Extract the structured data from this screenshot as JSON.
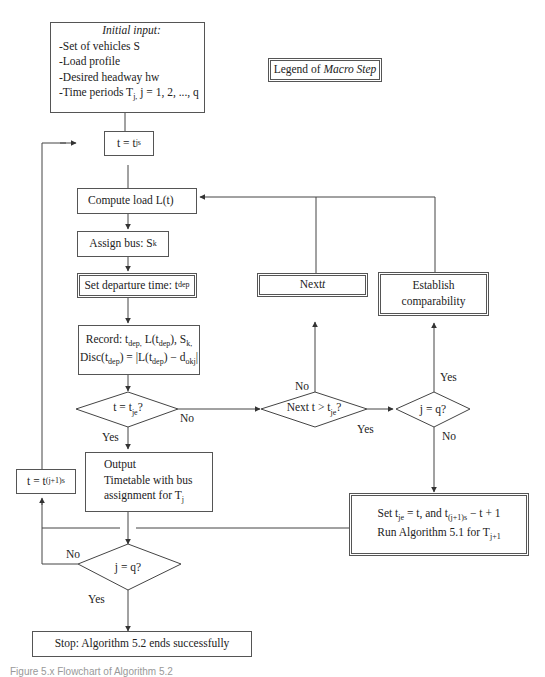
{
  "diagram": {
    "type": "flowchart",
    "initial_input": {
      "title": "Initial input:",
      "items": [
        "-Set of vehicles S",
        "-Load profile",
        "-Desired headway hw",
        "-Time periods T",
        "j = 1, 2, ..., q"
      ],
      "subscript_j": "j,"
    },
    "legend": {
      "prefix": "Legend of ",
      "macro": "Macro Step"
    },
    "nodes": {
      "t_js": {
        "text": "t = t",
        "sub": "js"
      },
      "compute_load": {
        "text": "Compute load L(t)"
      },
      "assign_bus": {
        "text": "Assign bus: S",
        "sub": "k"
      },
      "set_departure": {
        "text": "Set departure time: t",
        "sub": "dep"
      },
      "record": {
        "line1": "Record: t_dep, L(t_dep), S_k,",
        "line2": "Disc(t_dep) = |L(t_dep) − d_okj|"
      },
      "decision_t_je": {
        "text": "t = t",
        "sub": "je",
        "suffix": "?"
      },
      "decision_next_t": {
        "text": "Next t > t",
        "sub": "je",
        "suffix": "?"
      },
      "decision_j_q_right": {
        "text": "j = q?"
      },
      "next_t": {
        "text": "Next ",
        "var": "t"
      },
      "establish": {
        "line1": "Establish",
        "line2": "comparability"
      },
      "output": {
        "line1": "Output",
        "line2": "Timetable with bus",
        "line3": "assignment for T",
        "sub": "j"
      },
      "t_j1s": {
        "text": "t = t",
        "sub": "(j+1)s"
      },
      "set_tje": {
        "line1a": "Set t",
        "sub1": "je",
        "line1b": " = t, and t",
        "sub2": "(j+1)s",
        "line1c": " − t + 1",
        "line2": "Run Algorithm 5.1 for T",
        "sub3": "j+1"
      },
      "decision_j_q_bottom": {
        "text": "j = q?"
      },
      "stop": {
        "text": "Stop: Algorithm 5.2 ends successfully"
      }
    },
    "edge_labels": {
      "yes": "Yes",
      "no": "No"
    },
    "caption": "Figure 5.x Flowchart of Algorithm 5.2"
  }
}
